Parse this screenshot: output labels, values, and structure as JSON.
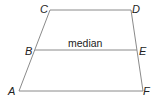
{
  "diagram": {
    "type": "trapezoid-with-median",
    "vertices": {
      "A": {
        "label": "A",
        "x": 19,
        "y": 91
      },
      "B": {
        "label": "B",
        "x": 35,
        "y": 50
      },
      "C": {
        "label": "C",
        "x": 50,
        "y": 10
      },
      "D": {
        "label": "D",
        "x": 131,
        "y": 10
      },
      "E": {
        "label": "E",
        "x": 137,
        "y": 50
      },
      "F": {
        "label": "F",
        "x": 143,
        "y": 91
      }
    },
    "median_label": "median",
    "colors": {
      "edge": "#8a8a8a",
      "text": "#222222",
      "background": "#ffffff"
    }
  }
}
